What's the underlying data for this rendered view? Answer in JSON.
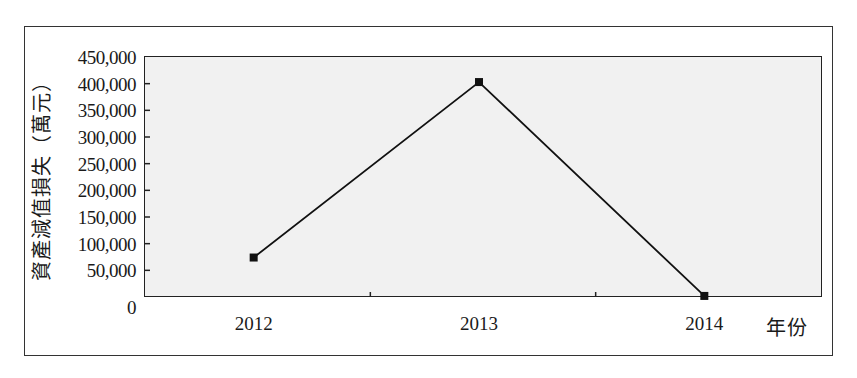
{
  "chart_data": {
    "type": "line",
    "title": "",
    "xlabel": "年份",
    "ylabel": "資產減值損失（萬元）",
    "categories": [
      "2012",
      "2013",
      "2014"
    ],
    "series": [
      {
        "name": "資產減值損失",
        "values": [
          74000,
          403000,
          2000
        ],
        "marker": "square",
        "color": "#111111"
      }
    ],
    "ylim": [
      0,
      450000
    ],
    "yticks": [
      "0",
      "50,000",
      "100,000",
      "150,000",
      "200,000",
      "250,000",
      "300,000",
      "350,000",
      "400,000",
      "450,000"
    ],
    "grid": false,
    "legend": "none"
  },
  "labels": {
    "x_axis_title": "年份",
    "y_axis_title": "資產減值損失（萬元）"
  }
}
